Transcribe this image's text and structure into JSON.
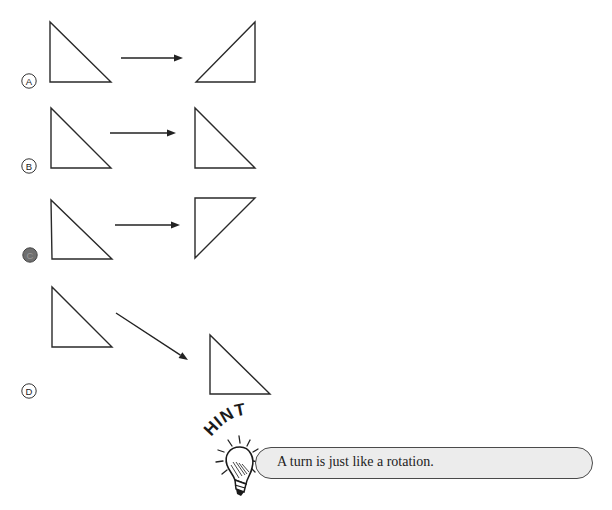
{
  "question": {
    "choices": [
      {
        "letter": "A",
        "selected": false,
        "bubble": {
          "cx": 29,
          "cy": 81
        },
        "original": [
          [
            50,
            22
          ],
          [
            50,
            82
          ],
          [
            111,
            82
          ]
        ],
        "arrow": {
          "x1": 121,
          "y1": 58,
          "x2": 183,
          "y2": 58
        },
        "result": [
          [
            255,
            22
          ],
          [
            255,
            82
          ],
          [
            196,
            82
          ]
        ]
      },
      {
        "letter": "B",
        "selected": false,
        "bubble": {
          "cx": 29,
          "cy": 166
        },
        "original": [
          [
            51,
            108
          ],
          [
            51,
            168
          ],
          [
            111,
            168
          ]
        ],
        "arrow": {
          "x1": 110,
          "y1": 133,
          "x2": 176,
          "y2": 133
        },
        "result": [
          [
            195,
            108
          ],
          [
            195,
            168
          ],
          [
            255,
            168
          ]
        ]
      },
      {
        "letter": "C",
        "selected": true,
        "bubble": {
          "cx": 30,
          "cy": 255
        },
        "original": [
          [
            51,
            200
          ],
          [
            52,
            259
          ],
          [
            112,
            259
          ]
        ],
        "arrow": {
          "x1": 115,
          "y1": 225,
          "x2": 180,
          "y2": 225
        },
        "result": [
          [
            195,
            198
          ],
          [
            255,
            198
          ],
          [
            195,
            258
          ]
        ]
      },
      {
        "letter": "D",
        "selected": false,
        "bubble": {
          "cx": 29,
          "cy": 391
        },
        "original": [
          [
            52,
            287
          ],
          [
            52,
            347
          ],
          [
            112,
            347
          ]
        ],
        "arrow": {
          "x1": 116,
          "y1": 313,
          "x2": 188,
          "y2": 360
        },
        "result": [
          [
            210,
            335
          ],
          [
            210,
            394
          ],
          [
            270,
            394
          ]
        ]
      }
    ]
  },
  "hint": {
    "label": "HINT",
    "icon": "lightbulb-icon",
    "text": "A turn is just like a rotation."
  },
  "colors": {
    "stroke": "#2a2a2a",
    "hint_fill": "#ececec",
    "hint_border": "#4a4a4a",
    "selected_bubble": "#6f6f6f"
  }
}
